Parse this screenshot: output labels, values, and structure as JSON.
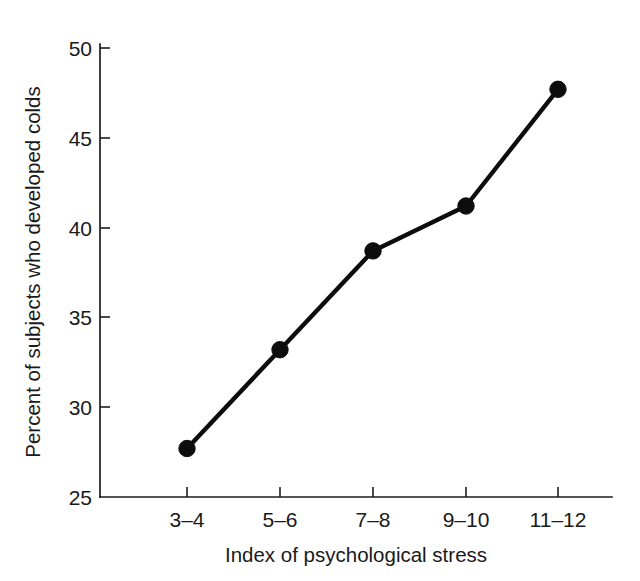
{
  "chart_data": {
    "type": "line",
    "title": "",
    "xlabel": "Index of psychological stress",
    "ylabel": "Percent of subjects who developed colds",
    "categories": [
      "3–4",
      "5–6",
      "7–8",
      "9–10",
      "11–12"
    ],
    "values": [
      27.7,
      33.2,
      38.7,
      41.2,
      47.7
    ],
    "series": [
      {
        "name": "Percent who developed colds",
        "values": [
          27.7,
          33.2,
          38.7,
          41.2,
          47.7
        ]
      }
    ],
    "ylim": [
      25,
      50
    ],
    "yticks": [
      25,
      30,
      35,
      40,
      45,
      50
    ],
    "ytick_labels": [
      "25",
      "30",
      "35",
      "40",
      "45",
      "50"
    ],
    "xtick_labels": [
      "3–4",
      "5–6",
      "7–8",
      "9–10",
      "11–12"
    ],
    "grid": false,
    "legend": false,
    "legend_position": "none",
    "marker": "filled-circle",
    "line_color": "#0d0d0d",
    "marker_color": "#0d0d0d",
    "background_color": "#ffffff",
    "axis_color": "#1d1d1d"
  }
}
